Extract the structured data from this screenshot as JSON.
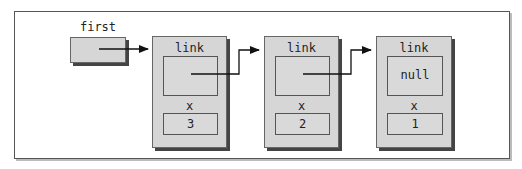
{
  "diagram": {
    "head_label": "first",
    "nodes": [
      {
        "link_label": "link",
        "link_value": "",
        "x_label": "x",
        "x_value": "3"
      },
      {
        "link_label": "link",
        "link_value": "",
        "x_label": "x",
        "x_value": "2"
      },
      {
        "link_label": "link",
        "link_value": "null",
        "x_label": "x",
        "x_value": "1"
      }
    ]
  }
}
